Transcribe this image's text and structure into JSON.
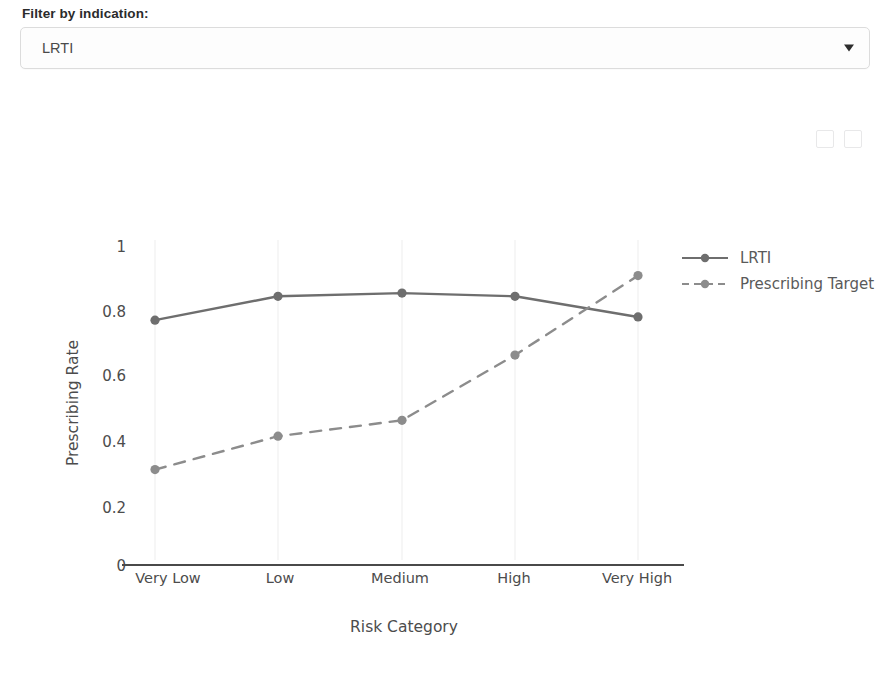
{
  "filter": {
    "label": "Filter by indication:",
    "selected": "LRTI",
    "placeholder": "Select indication",
    "caret_icon": "chevron-down-icon",
    "options": [
      "LRTI"
    ]
  },
  "toolbar": {
    "icons": [
      "pan-icon",
      "zoom-icon"
    ]
  },
  "chart_data": {
    "type": "line",
    "title": "",
    "xlabel": "Risk Category",
    "ylabel": "Prescribing Rate",
    "categories": [
      "Very Low",
      "Low",
      "Medium",
      "High",
      "Very High"
    ],
    "ylim": [
      0,
      1
    ],
    "yticks": [
      0,
      0.2,
      0.4,
      0.6,
      0.8,
      1
    ],
    "ytick_labels": [
      "0",
      "0.2",
      "0.4",
      "0.6",
      "0.8",
      "1"
    ],
    "grid": false,
    "legend_position": "right",
    "series": [
      {
        "name": "LRTI",
        "style": "solid",
        "color": "#6e6e6e",
        "values": [
          0.77,
          0.845,
          0.855,
          0.845,
          0.78
        ]
      },
      {
        "name": "Prescribing Target",
        "style": "dashed",
        "color": "#8c8c8c",
        "values": [
          0.3,
          0.405,
          0.455,
          0.66,
          0.91
        ]
      }
    ]
  }
}
